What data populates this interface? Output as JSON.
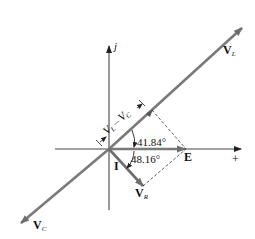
{
  "diagram": {
    "type": "phasor-diagram",
    "axes": {
      "imaginary_label": "j",
      "real_label": "+"
    },
    "phasors": [
      {
        "id": "VL",
        "label_main": "V",
        "label_sub": "L",
        "direction": "up-right"
      },
      {
        "id": "VC",
        "label_main": "V",
        "label_sub": "C",
        "direction": "down-left"
      },
      {
        "id": "VR",
        "label_main": "V",
        "label_sub": "R",
        "direction": "down-right"
      },
      {
        "id": "E",
        "label_main": "E",
        "direction": "horizontal"
      },
      {
        "id": "I",
        "label_main": "I"
      }
    ],
    "dimension_label": {
      "a_main": "V",
      "a_sub": "L",
      "op": "–",
      "b_main": "V",
      "b_sub": "C"
    },
    "angles": [
      {
        "value": "41.84°",
        "between": "E and VL−VC"
      },
      {
        "value": "48.16°",
        "between": "E and VR"
      }
    ],
    "colors": {
      "phasor": "#7a7a7a",
      "axis": "#333333",
      "dashed": "#333333",
      "text": "#111111"
    }
  }
}
